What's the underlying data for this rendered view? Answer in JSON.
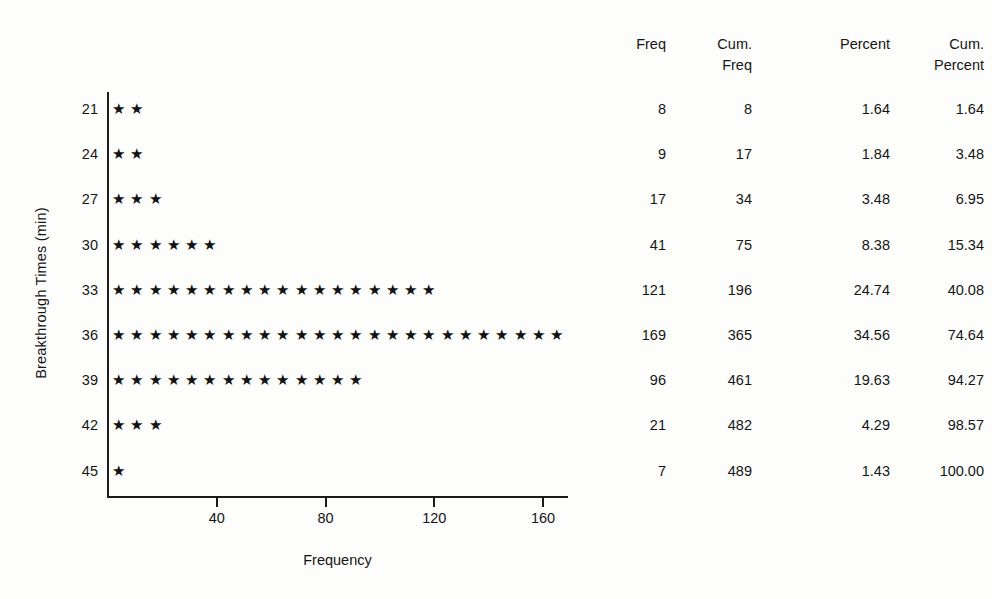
{
  "chart_data": {
    "type": "bar",
    "style": "star-plot (horizontal frequency chart, one star per ~6.7 units)",
    "title": "",
    "xlabel": "Frequency",
    "ylabel": "Breakthrough Times (min)",
    "categories": [
      "21",
      "24",
      "27",
      "30",
      "33",
      "36",
      "39",
      "42",
      "45"
    ],
    "values": [
      8,
      9,
      17,
      41,
      121,
      169,
      96,
      21,
      7
    ],
    "stars_per_row": [
      2,
      2,
      3,
      6,
      18,
      25,
      14,
      3,
      1
    ],
    "xticks": [
      40,
      80,
      120,
      160
    ],
    "xlim": [
      0,
      172
    ],
    "grid": false,
    "legend": null,
    "series": [
      {
        "name": "Freq",
        "values": [
          8,
          9,
          17,
          41,
          121,
          169,
          96,
          21,
          7
        ]
      },
      {
        "name": "Cum. Freq",
        "values": [
          8,
          17,
          34,
          75,
          196,
          365,
          461,
          482,
          489
        ]
      },
      {
        "name": "Percent",
        "values": [
          1.64,
          1.84,
          3.48,
          8.38,
          24.74,
          34.56,
          19.63,
          4.29,
          1.43
        ]
      },
      {
        "name": "Cum. Percent",
        "values": [
          1.64,
          3.48,
          6.95,
          15.34,
          40.08,
          74.64,
          94.27,
          98.57,
          100.0
        ]
      }
    ]
  },
  "axes": {
    "y_title": "Breakthrough Times (min)",
    "x_title": "Frequency",
    "y_ticks": [
      "21",
      "24",
      "27",
      "30",
      "33",
      "36",
      "39",
      "42",
      "45"
    ],
    "x_ticks": [
      "40",
      "80",
      "120",
      "160"
    ]
  },
  "marker": {
    "glyph": "★",
    "name": "star-marker"
  },
  "table": {
    "headers": [
      "Freq",
      "Cum.\nFreq",
      "Percent",
      "Cum.\nPercent"
    ],
    "rows": [
      [
        "8",
        "8",
        "1.64",
        "1.64"
      ],
      [
        "9",
        "17",
        "1.84",
        "3.48"
      ],
      [
        "17",
        "34",
        "3.48",
        "6.95"
      ],
      [
        "41",
        "75",
        "8.38",
        "15.34"
      ],
      [
        "121",
        "196",
        "24.74",
        "40.08"
      ],
      [
        "169",
        "365",
        "34.56",
        "74.64"
      ],
      [
        "96",
        "461",
        "19.63",
        "94.27"
      ],
      [
        "21",
        "482",
        "4.29",
        "98.57"
      ],
      [
        "7",
        "489",
        "1.43",
        "100.00"
      ]
    ]
  },
  "colors": {
    "ink": "#151515",
    "axis": "#1b1b1b",
    "background": "#fdfdfc"
  }
}
